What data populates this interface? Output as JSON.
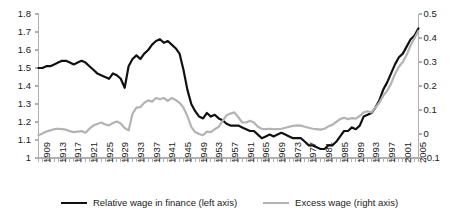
{
  "chart_data": {
    "type": "line",
    "title": "",
    "xlabel": "",
    "ylabel": "",
    "grid": false,
    "legend_position": "bottom",
    "x": [
      1909,
      1910,
      1911,
      1912,
      1913,
      1914,
      1915,
      1916,
      1917,
      1918,
      1919,
      1920,
      1921,
      1922,
      1923,
      1924,
      1925,
      1926,
      1927,
      1928,
      1929,
      1930,
      1931,
      1932,
      1933,
      1934,
      1935,
      1936,
      1937,
      1938,
      1939,
      1940,
      1941,
      1942,
      1943,
      1944,
      1945,
      1946,
      1947,
      1948,
      1949,
      1950,
      1951,
      1952,
      1953,
      1954,
      1955,
      1956,
      1957,
      1958,
      1959,
      1960,
      1961,
      1962,
      1963,
      1964,
      1965,
      1966,
      1967,
      1968,
      1969,
      1970,
      1971,
      1972,
      1973,
      1974,
      1975,
      1976,
      1977,
      1978,
      1979,
      1980,
      1981,
      1982,
      1983,
      1984,
      1985,
      1986,
      1987,
      1988,
      1989,
      1990,
      1991,
      1992,
      1993,
      1994,
      1995,
      1996,
      1997,
      1998,
      1999,
      2000,
      2001,
      2002,
      2003,
      2004,
      2005,
      2006
    ],
    "x_tick_labels": [
      1909,
      1913,
      1917,
      1921,
      1925,
      1929,
      1933,
      1937,
      1941,
      1945,
      1949,
      1953,
      1957,
      1961,
      1965,
      1969,
      1973,
      1977,
      1981,
      1985,
      1989,
      1993,
      1997,
      2001,
      2005
    ],
    "left_axis": {
      "label": "",
      "ticks": [
        1,
        1.1,
        1.2,
        1.3,
        1.4,
        1.5,
        1.6,
        1.7,
        1.8
      ],
      "tick_labels": [
        "1",
        "1.1",
        "1.2",
        "1.3",
        "1.4",
        "1.5",
        "1.6",
        "1.7",
        "1.8"
      ],
      "ylim": [
        1,
        1.8
      ]
    },
    "right_axis": {
      "label": "",
      "ticks": [
        -0.1,
        0,
        0.1,
        0.2,
        0.3,
        0.4,
        0.5
      ],
      "tick_labels": [
        "-0.1",
        "0",
        "0.1",
        "0.2",
        "0.3",
        "0.4",
        "0.5"
      ],
      "ylim": [
        -0.1,
        0.5
      ]
    },
    "series": [
      {
        "name": "Relative wage in finance (left axis)",
        "axis": "left",
        "color": "#111111",
        "width": 2.2,
        "values": [
          1.5,
          1.5,
          1.51,
          1.51,
          1.52,
          1.53,
          1.54,
          1.54,
          1.53,
          1.52,
          1.53,
          1.54,
          1.53,
          1.51,
          1.49,
          1.47,
          1.46,
          1.45,
          1.44,
          1.47,
          1.46,
          1.44,
          1.39,
          1.51,
          1.55,
          1.57,
          1.55,
          1.58,
          1.6,
          1.63,
          1.65,
          1.66,
          1.64,
          1.65,
          1.63,
          1.61,
          1.58,
          1.49,
          1.38,
          1.3,
          1.26,
          1.23,
          1.22,
          1.25,
          1.23,
          1.24,
          1.22,
          1.21,
          1.19,
          1.18,
          1.18,
          1.18,
          1.17,
          1.16,
          1.15,
          1.15,
          1.13,
          1.11,
          1.12,
          1.13,
          1.12,
          1.13,
          1.14,
          1.13,
          1.12,
          1.11,
          1.11,
          1.11,
          1.09,
          1.07,
          1.07,
          1.06,
          1.05,
          1.05,
          1.07,
          1.07,
          1.09,
          1.12,
          1.15,
          1.15,
          1.17,
          1.16,
          1.18,
          1.23,
          1.24,
          1.25,
          1.28,
          1.32,
          1.38,
          1.42,
          1.47,
          1.52,
          1.56,
          1.58,
          1.62,
          1.66,
          1.68,
          1.72
        ]
      },
      {
        "name": "Excess wage (right axis)",
        "axis": "right",
        "color": "#b3b3b3",
        "width": 2.2,
        "values": [
          -0.005,
          0.002,
          0.01,
          0.015,
          0.02,
          0.022,
          0.02,
          0.018,
          0.012,
          0.008,
          0.01,
          0.012,
          0.005,
          0.022,
          0.035,
          0.042,
          0.048,
          0.04,
          0.036,
          0.046,
          0.052,
          0.044,
          0.025,
          0.015,
          0.085,
          0.11,
          0.112,
          0.13,
          0.14,
          0.135,
          0.15,
          0.145,
          0.15,
          0.138,
          0.15,
          0.142,
          0.13,
          0.11,
          0.075,
          0.03,
          0.008,
          0.0,
          -0.005,
          0.01,
          0.008,
          0.02,
          0.03,
          0.055,
          0.078,
          0.085,
          0.09,
          0.07,
          0.048,
          0.048,
          0.055,
          0.048,
          0.03,
          0.022,
          0.02,
          0.022,
          0.02,
          0.02,
          0.022,
          0.026,
          0.03,
          0.034,
          0.036,
          0.035,
          0.03,
          0.026,
          0.022,
          0.02,
          0.018,
          0.022,
          0.032,
          0.038,
          0.05,
          0.062,
          0.068,
          0.062,
          0.066,
          0.064,
          0.075,
          0.09,
          0.095,
          0.09,
          0.11,
          0.13,
          0.16,
          0.18,
          0.21,
          0.25,
          0.28,
          0.3,
          0.33,
          0.37,
          0.4,
          0.43
        ]
      }
    ]
  },
  "legend": {
    "entries": [
      {
        "label": "Relative wage in finance (left axis)",
        "color": "#111111"
      },
      {
        "label": "Excess wage (right axis)",
        "color": "#b3b3b3"
      }
    ]
  },
  "colors": {
    "series_primary": "#111111",
    "series_secondary": "#b3b3b3",
    "axis": "#b0b0b0",
    "text": "#1a1a1a",
    "background": "#ffffff"
  }
}
